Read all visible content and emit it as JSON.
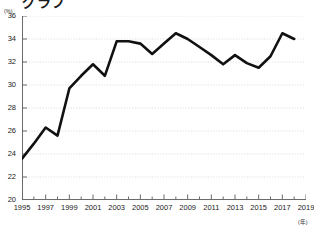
{
  "header": {
    "title": "グラフ"
  },
  "axis": {
    "y_unit": "(%)",
    "x_unit": "(年)"
  },
  "chart_data": {
    "type": "line",
    "title": "",
    "xlabel": "(年)",
    "ylabel": "(%)",
    "xlim": [
      1995,
      2019
    ],
    "ylim": [
      20,
      36
    ],
    "grid": true,
    "legend": "none",
    "ytick_labels": [
      "36",
      "34",
      "32",
      "30",
      "28",
      "26",
      "24",
      "22",
      "20"
    ],
    "yticks": [
      36,
      34,
      32,
      30,
      28,
      26,
      24,
      22,
      20
    ],
    "xtick_labels": [
      "1995",
      "1997",
      "1999",
      "2001",
      "2003",
      "2005",
      "2007",
      "2009",
      "2011",
      "2013",
      "2015",
      "2017",
      "2019"
    ],
    "xticks": [
      1995,
      1997,
      1999,
      2001,
      2003,
      2005,
      2007,
      2009,
      2011,
      2013,
      2015,
      2017,
      2019
    ],
    "x": [
      1995,
      1996,
      1997,
      1998,
      1999,
      2000,
      2001,
      2002,
      2003,
      2004,
      2005,
      2006,
      2007,
      2008,
      2009,
      2010,
      2011,
      2012,
      2013,
      2014,
      2015,
      2016,
      2017,
      2018
    ],
    "values": [
      23.6,
      24.9,
      26.3,
      25.6,
      29.7,
      30.8,
      31.8,
      30.8,
      33.8,
      33.8,
      33.6,
      32.7,
      33.6,
      34.5,
      34.0,
      33.3,
      32.6,
      31.8,
      32.6,
      31.9,
      31.5,
      32.5,
      34.5,
      34.0
    ],
    "series": [
      {
        "name": "series-1",
        "color": "#111111",
        "values": [
          23.6,
          24.9,
          26.3,
          25.6,
          29.7,
          30.8,
          31.8,
          30.8,
          33.8,
          33.8,
          33.6,
          32.7,
          33.6,
          34.5,
          34.0,
          33.3,
          32.6,
          31.8,
          32.6,
          31.9,
          31.5,
          32.5,
          34.5,
          34.0
        ]
      }
    ]
  }
}
